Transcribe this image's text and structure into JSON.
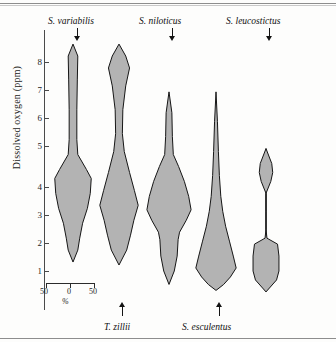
{
  "figure": {
    "type": "violin-plot",
    "ylabel": "Dissolved oxygen (ppm)"
  },
  "axis": {
    "ticks": [
      {
        "value": "8",
        "y": 62
      },
      {
        "value": "7",
        "y": 90
      },
      {
        "value": "6",
        "y": 118
      },
      {
        "value": "5",
        "y": 146
      },
      {
        "value": "4",
        "y": 187
      },
      {
        "value": "3",
        "y": 215
      },
      {
        "value": "2",
        "y": 243
      },
      {
        "value": "1",
        "y": 271
      }
    ]
  },
  "scale": {
    "left_label": "50",
    "center_label": "0",
    "right_label": "50",
    "unit_label": "%"
  },
  "species": [
    {
      "name": "S. variabilis",
      "position": "top",
      "label_x": 48,
      "label_y": 16,
      "arrow_x": 73,
      "arrow_y": 28,
      "arrow_dir": "down"
    },
    {
      "name": "T. zillii",
      "position": "bottom",
      "label_x": 104,
      "label_y": 322,
      "arrow_x": 118,
      "arrow_y": 302,
      "arrow_dir": "up"
    },
    {
      "name": "S. niloticus",
      "position": "top",
      "label_x": 139,
      "label_y": 16,
      "arrow_x": 168,
      "arrow_y": 28,
      "arrow_dir": "down"
    },
    {
      "name": "S. esculentus",
      "position": "bottom",
      "label_x": 182,
      "label_y": 322,
      "arrow_x": 215,
      "arrow_y": 302,
      "arrow_dir": "up"
    },
    {
      "name": "S. leucostictus",
      "position": "top",
      "label_x": 226,
      "label_y": 16,
      "arrow_x": 265,
      "arrow_y": 28,
      "arrow_dir": "down"
    }
  ],
  "chart_data": {
    "type": "violin",
    "title": "",
    "xlabel": "%",
    "ylabel": "Dissolved oxygen (ppm)",
    "ylim": [
      0,
      9
    ],
    "ytick_values": [
      1,
      2,
      3,
      4,
      5,
      6,
      7,
      8
    ],
    "grid": false,
    "legend": "none",
    "width_scale": {
      "half_width_percent": 50,
      "unit": "%"
    },
    "series": [
      {
        "name": "S. variabilis",
        "center_x": 73,
        "min_ppm": 1.3,
        "max_ppm": 8.6,
        "mode_ppm": 4.1,
        "profile": [
          {
            "ppm": 8.6,
            "halfwidth_pct": 0
          },
          {
            "ppm": 8.2,
            "halfwidth_pct": 10
          },
          {
            "ppm": 7.4,
            "halfwidth_pct": 9
          },
          {
            "ppm": 6.4,
            "halfwidth_pct": 8
          },
          {
            "ppm": 5.4,
            "halfwidth_pct": 8
          },
          {
            "ppm": 4.9,
            "halfwidth_pct": 10
          },
          {
            "ppm": 4.4,
            "halfwidth_pct": 28
          },
          {
            "ppm": 4.1,
            "halfwidth_pct": 38
          },
          {
            "ppm": 3.6,
            "halfwidth_pct": 36
          },
          {
            "ppm": 3.1,
            "halfwidth_pct": 30
          },
          {
            "ppm": 2.6,
            "halfwidth_pct": 20
          },
          {
            "ppm": 2.1,
            "halfwidth_pct": 14
          },
          {
            "ppm": 1.7,
            "halfwidth_pct": 10
          },
          {
            "ppm": 1.3,
            "halfwidth_pct": 0
          }
        ]
      },
      {
        "name": "T. zillii",
        "center_x": 119,
        "min_ppm": 1.2,
        "max_ppm": 8.6,
        "mode_ppm": 3.2,
        "profile": [
          {
            "ppm": 8.6,
            "halfwidth_pct": 0
          },
          {
            "ppm": 8.2,
            "halfwidth_pct": 14
          },
          {
            "ppm": 7.8,
            "halfwidth_pct": 22
          },
          {
            "ppm": 7.2,
            "halfwidth_pct": 14
          },
          {
            "ppm": 6.4,
            "halfwidth_pct": 8
          },
          {
            "ppm": 5.6,
            "halfwidth_pct": 7
          },
          {
            "ppm": 5.0,
            "halfwidth_pct": 11
          },
          {
            "ppm": 4.3,
            "halfwidth_pct": 22
          },
          {
            "ppm": 3.7,
            "halfwidth_pct": 32
          },
          {
            "ppm": 3.2,
            "halfwidth_pct": 40
          },
          {
            "ppm": 2.7,
            "halfwidth_pct": 31
          },
          {
            "ppm": 2.2,
            "halfwidth_pct": 24
          },
          {
            "ppm": 1.7,
            "halfwidth_pct": 16
          },
          {
            "ppm": 1.2,
            "halfwidth_pct": 0
          }
        ]
      },
      {
        "name": "S. niloticus",
        "center_x": 169,
        "min_ppm": 0.55,
        "max_ppm": 7.0,
        "mode_ppm": 3.05,
        "profile": [
          {
            "ppm": 7.0,
            "halfwidth_pct": 0
          },
          {
            "ppm": 6.3,
            "halfwidth_pct": 6
          },
          {
            "ppm": 5.5,
            "halfwidth_pct": 7
          },
          {
            "ppm": 4.9,
            "halfwidth_pct": 9
          },
          {
            "ppm": 4.5,
            "halfwidth_pct": 20
          },
          {
            "ppm": 4.0,
            "halfwidth_pct": 32
          },
          {
            "ppm": 3.5,
            "halfwidth_pct": 41
          },
          {
            "ppm": 3.05,
            "halfwidth_pct": 46
          },
          {
            "ppm": 2.7,
            "halfwidth_pct": 36
          },
          {
            "ppm": 2.3,
            "halfwidth_pct": 22
          },
          {
            "ppm": 2.05,
            "halfwidth_pct": 19
          },
          {
            "ppm": 1.5,
            "halfwidth_pct": 17
          },
          {
            "ppm": 1.0,
            "halfwidth_pct": 11
          },
          {
            "ppm": 0.55,
            "halfwidth_pct": 0
          }
        ]
      },
      {
        "name": "S. esculentus",
        "center_x": 216,
        "min_ppm": 0.35,
        "max_ppm": 7.0,
        "mode_ppm": 1.1,
        "profile": [
          {
            "ppm": 7.0,
            "halfwidth_pct": 0
          },
          {
            "ppm": 6.0,
            "halfwidth_pct": 3
          },
          {
            "ppm": 5.0,
            "halfwidth_pct": 5
          },
          {
            "ppm": 4.2,
            "halfwidth_pct": 7
          },
          {
            "ppm": 3.5,
            "halfwidth_pct": 10
          },
          {
            "ppm": 3.0,
            "halfwidth_pct": 14
          },
          {
            "ppm": 2.5,
            "halfwidth_pct": 20
          },
          {
            "ppm": 2.0,
            "halfwidth_pct": 28
          },
          {
            "ppm": 1.5,
            "halfwidth_pct": 36
          },
          {
            "ppm": 1.1,
            "halfwidth_pct": 42
          },
          {
            "ppm": 0.8,
            "halfwidth_pct": 30
          },
          {
            "ppm": 0.55,
            "halfwidth_pct": 16
          },
          {
            "ppm": 0.35,
            "halfwidth_pct": 0
          }
        ]
      },
      {
        "name": "S. leucostictus",
        "center_x": 266,
        "min_ppm": 0.3,
        "max_ppm": 5.1,
        "mode_ppm": 1.5,
        "bimodal": true,
        "profile": [
          {
            "ppm": 5.1,
            "halfwidth_pct": 0
          },
          {
            "ppm": 4.6,
            "halfwidth_pct": 12
          },
          {
            "ppm": 4.3,
            "halfwidth_pct": 14
          },
          {
            "ppm": 4.0,
            "halfwidth_pct": 10
          },
          {
            "ppm": 3.6,
            "halfwidth_pct": 0
          },
          {
            "ppm": 3.0,
            "halfwidth_pct": 0
          },
          {
            "ppm": 2.4,
            "halfwidth_pct": 0
          },
          {
            "ppm": 2.1,
            "halfwidth_pct": 2
          },
          {
            "ppm": 1.9,
            "halfwidth_pct": 24
          },
          {
            "ppm": 1.5,
            "halfwidth_pct": 27
          },
          {
            "ppm": 1.0,
            "halfwidth_pct": 27
          },
          {
            "ppm": 0.7,
            "halfwidth_pct": 22
          },
          {
            "ppm": 0.3,
            "halfwidth_pct": 0
          }
        ]
      }
    ]
  }
}
